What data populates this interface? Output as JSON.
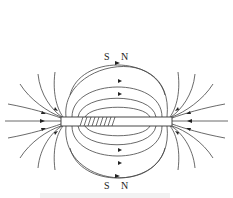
{
  "diagram": {
    "type": "magnetic-field-lines",
    "top_compass": {
      "left_label": "S",
      "right_label": "N"
    },
    "bottom_compass": {
      "left_label": "S",
      "right_label": "N"
    },
    "colors": {
      "line": "#333333",
      "background": "#ffffff"
    }
  }
}
